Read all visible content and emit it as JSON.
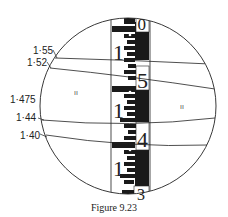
{
  "figure": {
    "caption": "Figure 9.23",
    "stadia_labels": [
      {
        "text": "1·55",
        "x": 33,
        "y": 46
      },
      {
        "text": "1·52",
        "x": 27,
        "y": 58
      },
      {
        "text": "1·475",
        "x": 10,
        "y": 95
      },
      {
        "text": "1·44",
        "x": 16,
        "y": 113
      },
      {
        "text": "1·40",
        "x": 20,
        "y": 131
      }
    ],
    "staff_numerals": [
      "0",
      "5",
      "4",
      "3"
    ],
    "staff_meter_marks": [
      "1",
      "1",
      "1"
    ],
    "hair_marks": [
      "ıı",
      "ıı"
    ],
    "colors": {
      "ink": "#222222",
      "background": "#ffffff"
    }
  }
}
